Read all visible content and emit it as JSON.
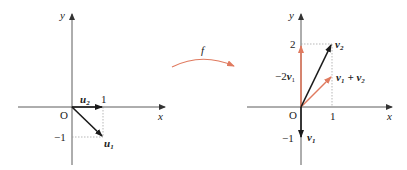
{
  "colors": {
    "axis": "#333333",
    "vector": "#1a1a1a",
    "accent": "#e07a5f",
    "guide": "#999999"
  },
  "map_label": "f",
  "left": {
    "x_axis_label": "x",
    "y_axis_label": "y",
    "origin_label": "O",
    "tick_x": "1",
    "tick_y": "−1",
    "vectors": [
      {
        "name": "u2",
        "label_base": "u",
        "label_sub": "2",
        "from": [
          0,
          0
        ],
        "to": [
          1,
          0
        ]
      },
      {
        "name": "u1",
        "label_base": "u",
        "label_sub": "1",
        "from": [
          0,
          0
        ],
        "to": [
          1,
          -1
        ]
      }
    ]
  },
  "right": {
    "x_axis_label": "x",
    "y_axis_label": "y",
    "origin_label": "O",
    "tick_x": "1",
    "tick_y_pos": "2",
    "tick_y_neg": "−1",
    "vectors": [
      {
        "name": "v2",
        "label_base": "v",
        "label_sub": "2",
        "from": [
          0,
          0
        ],
        "to": [
          1,
          2
        ]
      },
      {
        "name": "v1",
        "label_base": "v",
        "label_sub": "1",
        "from": [
          0,
          0
        ],
        "to": [
          0,
          -1
        ]
      },
      {
        "name": "-2v1",
        "label_prefix": "−2",
        "label_base": "v",
        "label_sub": "1",
        "from": [
          0,
          0
        ],
        "to": [
          0,
          2
        ]
      },
      {
        "name": "v1+v2",
        "label": "v₁ + v₂",
        "from": [
          0,
          0
        ],
        "to": [
          1,
          1
        ]
      }
    ]
  }
}
